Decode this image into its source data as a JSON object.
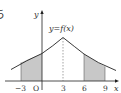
{
  "diagram": {
    "function_label": "y=f(x)",
    "axis_x_label": "x",
    "axis_y_label": "y",
    "origin_label": "O",
    "ticks": [
      {
        "value": -3,
        "label": "−3"
      },
      {
        "value": 3,
        "label": "3"
      },
      {
        "value": 6,
        "label": "6"
      },
      {
        "value": 9,
        "label": "9"
      }
    ],
    "peak_x": 3,
    "shaded_regions": [
      {
        "from": -3,
        "to": 0
      },
      {
        "from": 6,
        "to": 9
      }
    ],
    "margin_char": "ち",
    "colors": {
      "curve": "#222222",
      "axis": "#222222",
      "shade": "#c8c8c8",
      "dashed": "#555555"
    }
  }
}
